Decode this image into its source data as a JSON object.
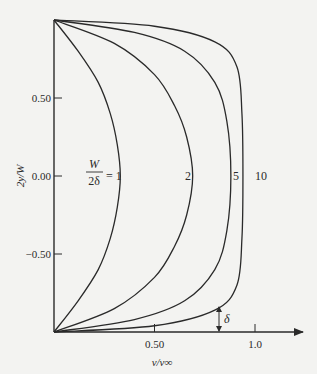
{
  "chart_data": {
    "type": "line",
    "title": "",
    "xlabel": "v/v∞",
    "ylabel": "2y/W",
    "xlim": [
      0,
      1.15
    ],
    "ylim": [
      -1,
      1
    ],
    "x_ticks": [
      {
        "value": 0.5,
        "label": "0.50"
      },
      {
        "value": 1.0,
        "label": "1.0"
      }
    ],
    "y_ticks": [
      {
        "value": 0.5,
        "label": "0.50"
      },
      {
        "value": 0.0,
        "label": "0.00"
      },
      {
        "value": -0.5,
        "label": "−0.50"
      }
    ],
    "grid": false,
    "parameter_label": {
      "numerator": "W",
      "denominator": "2δ",
      "equals": "= 1"
    },
    "series": [
      {
        "name": "1",
        "label": "1",
        "center_velocity": 0.33,
        "points": [
          [
            0,
            1
          ],
          [
            0.12,
            0.8
          ],
          [
            0.22,
            0.6
          ],
          [
            0.28,
            0.4
          ],
          [
            0.315,
            0.2
          ],
          [
            0.33,
            0
          ],
          [
            0.315,
            -0.2
          ],
          [
            0.28,
            -0.4
          ],
          [
            0.22,
            -0.6
          ],
          [
            0.12,
            -0.8
          ],
          [
            0,
            -1
          ]
        ]
      },
      {
        "name": "2",
        "label": "2",
        "center_velocity": 0.69,
        "points": [
          [
            0,
            1
          ],
          [
            0.3,
            0.85
          ],
          [
            0.5,
            0.65
          ],
          [
            0.6,
            0.45
          ],
          [
            0.66,
            0.25
          ],
          [
            0.69,
            0
          ],
          [
            0.66,
            -0.25
          ],
          [
            0.6,
            -0.45
          ],
          [
            0.5,
            -0.65
          ],
          [
            0.3,
            -0.85
          ],
          [
            0,
            -1
          ]
        ]
      },
      {
        "name": "5",
        "label": "5",
        "center_velocity": 0.88,
        "points": [
          [
            0,
            1
          ],
          [
            0.4,
            0.92
          ],
          [
            0.65,
            0.8
          ],
          [
            0.8,
            0.6
          ],
          [
            0.86,
            0.35
          ],
          [
            0.88,
            0
          ],
          [
            0.86,
            -0.35
          ],
          [
            0.8,
            -0.6
          ],
          [
            0.65,
            -0.8
          ],
          [
            0.4,
            -0.92
          ],
          [
            0,
            -1
          ]
        ]
      },
      {
        "name": "10",
        "label": "10",
        "center_velocity": 0.94,
        "points": [
          [
            0,
            1
          ],
          [
            0.5,
            0.96
          ],
          [
            0.8,
            0.86
          ],
          [
            0.91,
            0.7
          ],
          [
            0.935,
            0.4
          ],
          [
            0.94,
            0
          ],
          [
            0.935,
            -0.4
          ],
          [
            0.91,
            -0.7
          ],
          [
            0.8,
            -0.86
          ],
          [
            0.5,
            -0.96
          ],
          [
            0,
            -1
          ]
        ]
      }
    ],
    "annotations": [
      {
        "text": "δ",
        "description": "boundary-layer thickness arrow near wall",
        "x": 0.8
      }
    ]
  }
}
